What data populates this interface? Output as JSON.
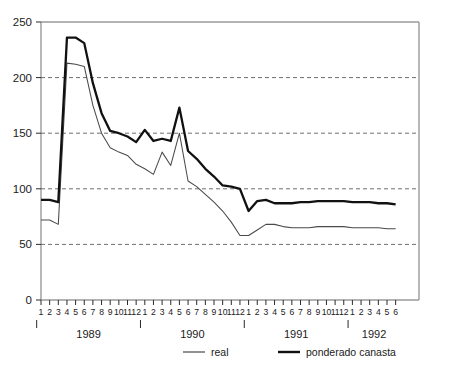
{
  "chart_data": {
    "type": "line",
    "title": "",
    "xlabel": "",
    "ylabel": "",
    "ylim": [
      0,
      250
    ],
    "yticks": [
      0,
      50,
      100,
      150,
      200,
      250
    ],
    "ytick_labels": [
      "0",
      "50",
      "100",
      "150",
      "200",
      "250"
    ],
    "grid": "horizontal dashed at 50, 100, 150, 200",
    "legend_position": "bottom",
    "x_months": [
      1,
      2,
      3,
      4,
      5,
      6,
      7,
      8,
      9,
      10,
      11,
      12,
      1,
      2,
      3,
      4,
      5,
      6,
      7,
      8,
      9,
      10,
      11,
      12,
      1,
      2,
      3,
      4,
      5,
      6,
      7,
      8,
      9,
      10,
      11,
      12,
      1,
      2,
      3,
      4,
      5,
      6
    ],
    "x_month_labels": [
      "1",
      "2",
      "3",
      "4",
      "5",
      "6",
      "7",
      "8",
      "9",
      "10",
      "11",
      "12",
      "1",
      "2",
      "3",
      "4",
      "5",
      "6",
      "7",
      "8",
      "9",
      "10",
      "11",
      "12",
      "1",
      "2",
      "3",
      "4",
      "5",
      "6",
      "7",
      "8",
      "9",
      "10",
      "11",
      "12",
      "1",
      "2",
      "3",
      "4",
      "5",
      "6"
    ],
    "years": [
      {
        "label": "1989",
        "start_index": 0,
        "end_index": 11,
        "tick_index": 5
      },
      {
        "label": "1990",
        "start_index": 12,
        "end_index": 23,
        "tick_index": 17
      },
      {
        "label": "1991",
        "start_index": 24,
        "end_index": 35,
        "tick_index": 29
      },
      {
        "label": "1992",
        "start_index": 36,
        "end_index": 41,
        "tick_index": 41
      }
    ],
    "series": [
      {
        "name": "real",
        "style": "thin",
        "color": "#4a4a4a",
        "values": [
          72,
          72,
          68,
          213,
          212,
          210,
          175,
          150,
          137,
          133,
          130,
          122,
          118,
          113,
          133,
          121,
          150,
          107,
          102,
          95,
          88,
          80,
          70,
          58,
          58,
          63,
          68,
          68,
          66,
          65,
          65,
          65,
          66,
          66,
          66,
          66,
          65,
          65,
          65,
          65,
          64,
          64
        ]
      },
      {
        "name": "ponderado canasta",
        "style": "thick",
        "color": "#111111",
        "values": [
          90,
          90,
          88,
          236,
          236,
          231,
          195,
          168,
          152,
          150,
          147,
          142,
          153,
          143,
          145,
          143,
          173,
          134,
          127,
          118,
          111,
          103,
          102,
          100,
          80,
          89,
          90,
          87,
          87,
          87,
          88,
          88,
          89,
          89,
          89,
          89,
          88,
          88,
          88,
          87,
          87,
          86
        ]
      }
    ],
    "legend": [
      {
        "label": "real",
        "style": "thin"
      },
      {
        "label": "ponderado canasta",
        "style": "thick"
      }
    ]
  },
  "axis": {
    "y_labels": [
      "250",
      "200",
      "150",
      "100",
      "50",
      "0"
    ]
  },
  "legend_labels": {
    "real": "real",
    "canasta": "ponderado canasta"
  }
}
